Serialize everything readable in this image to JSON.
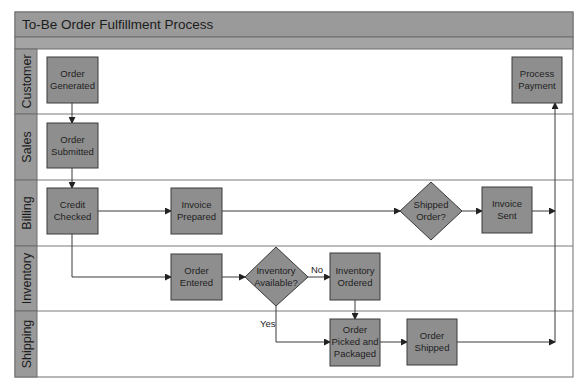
{
  "title": "To-Be Order Fulfillment Process",
  "lanes": [
    {
      "id": "customer",
      "label": "Customer"
    },
    {
      "id": "sales",
      "label": "Sales"
    },
    {
      "id": "billing",
      "label": "Billing"
    },
    {
      "id": "inventory",
      "label": "Inventory"
    },
    {
      "id": "shipping",
      "label": "Shipping"
    }
  ],
  "nodes": {
    "order_generated": {
      "shape": "process",
      "lane": "customer",
      "lines": [
        "Order",
        "Generated"
      ]
    },
    "process_payment": {
      "shape": "process",
      "lane": "customer",
      "lines": [
        "Process",
        "Payment"
      ]
    },
    "order_submitted": {
      "shape": "process",
      "lane": "sales",
      "lines": [
        "Order",
        "Submitted"
      ]
    },
    "credit_checked": {
      "shape": "process",
      "lane": "billing",
      "lines": [
        "Credit",
        "Checked"
      ]
    },
    "invoice_prepared": {
      "shape": "process",
      "lane": "billing",
      "lines": [
        "Invoice",
        "Prepared"
      ]
    },
    "shipped_order": {
      "shape": "decision",
      "lane": "billing",
      "lines": [
        "Shipped",
        "Order?"
      ]
    },
    "invoice_sent": {
      "shape": "process",
      "lane": "billing",
      "lines": [
        "Invoice",
        "Sent"
      ]
    },
    "order_entered": {
      "shape": "process",
      "lane": "inventory",
      "lines": [
        "Order",
        "Entered"
      ]
    },
    "inventory_available": {
      "shape": "decision",
      "lane": "inventory",
      "lines": [
        "Inventory",
        "Available?"
      ]
    },
    "inventory_ordered": {
      "shape": "process",
      "lane": "inventory",
      "lines": [
        "Inventory",
        "Ordered"
      ]
    },
    "order_picked": {
      "shape": "process",
      "lane": "shipping",
      "lines": [
        "Order",
        "Picked and",
        "Packaged"
      ]
    },
    "order_shipped": {
      "shape": "process",
      "lane": "shipping",
      "lines": [
        "Order",
        "Shipped"
      ]
    }
  },
  "edges": [
    {
      "from": "order_generated",
      "to": "order_submitted",
      "label": ""
    },
    {
      "from": "order_submitted",
      "to": "credit_checked",
      "label": ""
    },
    {
      "from": "credit_checked",
      "to": "invoice_prepared",
      "label": ""
    },
    {
      "from": "credit_checked",
      "to": "order_entered",
      "label": ""
    },
    {
      "from": "invoice_prepared",
      "to": "shipped_order",
      "label": ""
    },
    {
      "from": "shipped_order",
      "to": "invoice_sent",
      "label": ""
    },
    {
      "from": "invoice_sent",
      "to": "process_payment",
      "label": ""
    },
    {
      "from": "order_entered",
      "to": "inventory_available",
      "label": ""
    },
    {
      "from": "inventory_available",
      "to": "inventory_ordered",
      "label": "No"
    },
    {
      "from": "inventory_available",
      "to": "order_picked",
      "label": "Yes"
    },
    {
      "from": "inventory_ordered",
      "to": "order_picked",
      "label": ""
    },
    {
      "from": "order_picked",
      "to": "order_shipped",
      "label": ""
    },
    {
      "from": "order_shipped",
      "to": "process_payment",
      "label": ""
    }
  ],
  "edge_labels": {
    "no": "No",
    "yes": "Yes"
  }
}
